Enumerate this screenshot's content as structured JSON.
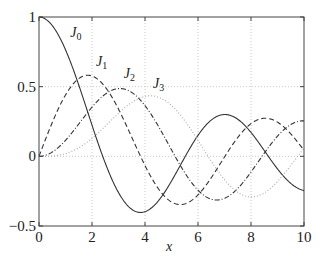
{
  "chart_data": {
    "type": "line",
    "title": "",
    "xlabel": "x",
    "ylabel": "",
    "xlim": [
      0,
      10
    ],
    "ylim": [
      -0.5,
      1
    ],
    "xticks": [
      0,
      2,
      4,
      6,
      8,
      10
    ],
    "xtick_labels": [
      "0",
      "2",
      "4",
      "6",
      "8",
      "10"
    ],
    "yticks": [
      -0.5,
      0,
      0.5,
      1
    ],
    "ytick_labels": [
      "−0.5",
      "0",
      "0.5",
      "1"
    ],
    "grid": true,
    "legend": "inline labels",
    "x": [
      0,
      0.5,
      1,
      1.5,
      2,
      2.5,
      3,
      3.5,
      4,
      4.5,
      5,
      5.5,
      6,
      6.5,
      7,
      7.5,
      8,
      8.5,
      9,
      9.5,
      10
    ],
    "series": [
      {
        "name": "J0",
        "label": "J",
        "sub": "0",
        "style": "solid",
        "color": "#333333",
        "values": [
          1,
          0.9385,
          0.7652,
          0.5118,
          0.2239,
          -0.0484,
          -0.2601,
          -0.3801,
          -0.3971,
          -0.3205,
          -0.1776,
          -0.0068,
          0.1506,
          0.2663,
          0.3001,
          0.2539,
          0.1717,
          0.0419,
          -0.0903,
          -0.1939,
          -0.2459
        ]
      },
      {
        "name": "J1",
        "label": "J",
        "sub": "1",
        "style": "dashed",
        "color": "#333333",
        "values": [
          0,
          0.2423,
          0.4401,
          0.5579,
          0.5767,
          0.4971,
          0.3391,
          0.1374,
          -0.066,
          -0.2311,
          -0.3276,
          -0.3414,
          -0.2767,
          -0.1538,
          -0.0047,
          0.1352,
          0.2346,
          0.2731,
          0.2453,
          0.1711,
          0.0435
        ]
      },
      {
        "name": "J2",
        "label": "J",
        "sub": "2",
        "style": "dashdot",
        "color": "#333333",
        "values": [
          0,
          0.0306,
          0.1149,
          0.2321,
          0.3528,
          0.4461,
          0.4861,
          0.4586,
          0.3641,
          0.2178,
          0.0466,
          -0.1183,
          -0.2429,
          -0.3014,
          -0.3014,
          -0.2406,
          -0.113,
          0.0272,
          0.1448,
          0.2214,
          0.2546
        ]
      },
      {
        "name": "J3",
        "label": "J",
        "sub": "3",
        "style": "dotted",
        "color": "#aaaaaa",
        "values": [
          0,
          0.0026,
          0.0196,
          0.061,
          0.1289,
          0.2174,
          0.3091,
          0.3868,
          0.4302,
          0.4247,
          0.3648,
          0.2559,
          0.1148,
          -0.0331,
          -0.1676,
          -0.2665,
          -0.2911,
          -0.247,
          -0.1809,
          -0.0726,
          0.0584
        ]
      }
    ],
    "annotations": [
      {
        "text": "J0",
        "x": 1.18,
        "y": 0.86
      },
      {
        "text": "J1",
        "x": 2.15,
        "y": 0.65
      },
      {
        "text": "J2",
        "x": 3.2,
        "y": 0.56
      },
      {
        "text": "J3",
        "x": 4.3,
        "y": 0.49
      }
    ]
  }
}
